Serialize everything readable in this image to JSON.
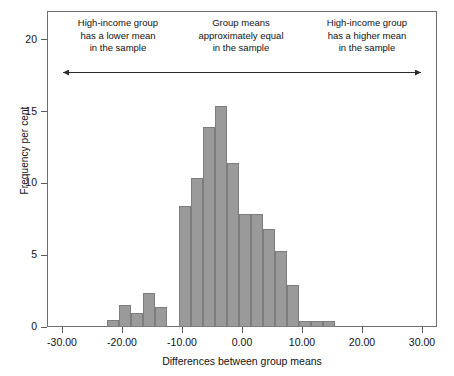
{
  "chart_data": {
    "type": "bar",
    "title": "",
    "subtitle": "",
    "xlabel": "Differences between group means",
    "ylabel": "Frequency per cent",
    "xlim": [
      -32.5,
      32.5
    ],
    "ylim": [
      0,
      22
    ],
    "xticks": [
      -30,
      -20,
      -10,
      0,
      10,
      20,
      30
    ],
    "xtick_labels": [
      "-30.00",
      "-20.00",
      "-10.00",
      "0.00",
      "10.00",
      "20.00",
      "30.00"
    ],
    "yticks": [
      0,
      5,
      10,
      15,
      20
    ],
    "ytick_labels": [
      "0",
      "5",
      "10",
      "15",
      "20"
    ],
    "grid": false,
    "legend": "none",
    "bar_color": "#9a9a9a",
    "bar_edge_color": "#7d7d7d",
    "bin_width": 2.0,
    "bin_left_edges": [
      -22.5,
      -20.5,
      -18.5,
      -16.5,
      -14.5,
      -12.5,
      -10.5,
      -8.5,
      -6.5,
      -4.5,
      -2.5,
      -0.5,
      1.5,
      3.5,
      5.5,
      7.5,
      9.5,
      11.5,
      13.5,
      15.5,
      17.5,
      19.5
    ],
    "categories": [
      "-21.5",
      "-19.5",
      "-17.5",
      "-15.5",
      "-13.5",
      "-11.5",
      "-9.5",
      "-7.5",
      "-5.5",
      "-3.5",
      "-1.5",
      "0.5",
      "2.5",
      "4.5",
      "6.5",
      "8.5",
      "10.5",
      "12.5",
      "14.5",
      "16.5",
      "18.5",
      "20.5"
    ],
    "values": [
      0.5,
      1.5,
      1.0,
      2.4,
      1.4,
      0.0,
      8.4,
      10.4,
      13.9,
      15.4,
      11.4,
      7.9,
      7.9,
      6.8,
      5.3,
      2.9,
      0.4,
      0.4,
      0.4,
      0.0,
      0.0,
      0.0
    ],
    "annotations": [
      {
        "name": "left-region-note",
        "text": "High-income group\nhas a lower mean\nin the sample",
        "position": "top-left"
      },
      {
        "name": "middle-region-note",
        "text": "Group means\napproximately equal\nin the sample",
        "position": "top-center"
      },
      {
        "name": "right-region-note",
        "text": "High-income group\nhas a higher mean\nin the sample",
        "position": "top-right"
      },
      {
        "name": "double-headed-arrow",
        "text": "",
        "position": "below-notes"
      }
    ]
  },
  "axes": {
    "y_title": "Frequency per cent",
    "x_title": "Differences between group means"
  },
  "notes": {
    "left": "High-income group\nhas a lower mean\nin the sample",
    "middle": "Group means\napproximately equal\nin the sample",
    "right": "High-income group\nhas a higher mean\nin the sample"
  }
}
